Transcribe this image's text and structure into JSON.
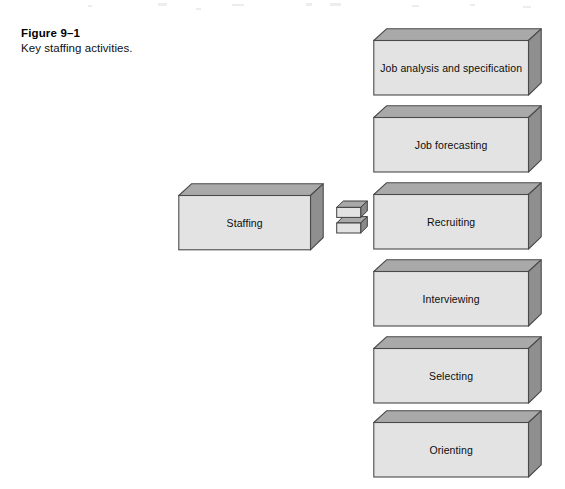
{
  "figure": {
    "number_label": "Figure 9–1",
    "caption": "Key staffing activities."
  },
  "diagram": {
    "type": "3d-block-diagram",
    "source_node": {
      "label": "Staffing",
      "name": "staffing-block"
    },
    "connector": {
      "name": "equals-connector",
      "symbol": "=",
      "description": "two stacked 3D slabs forming an equals sign"
    },
    "activity_blocks": [
      {
        "label": "Job analysis and specification"
      },
      {
        "label": "Job forecasting"
      },
      {
        "label": "Recruiting"
      },
      {
        "label": "Interviewing"
      },
      {
        "label": "Selecting"
      },
      {
        "label": "Orienting"
      }
    ]
  },
  "colors": {
    "page_background": "#ffffff",
    "block_front_face": "#e3e3e3",
    "block_top_face": "#a9a9a9",
    "block_side_face": "#8f8f8f",
    "block_outline": "#4a4a4a",
    "text": "#0d0d0d"
  }
}
